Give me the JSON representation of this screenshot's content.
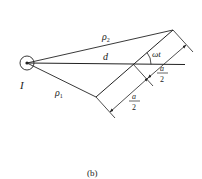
{
  "figure": {
    "caption": "(b)",
    "labels": {
      "source": "I",
      "rho1_base": "ρ",
      "rho1_sub": "1",
      "rho2_base": "ρ",
      "rho2_sub": "2",
      "distance": "d",
      "angle": "ωt",
      "half_a_upper_num": "a",
      "half_a_upper_den": "2",
      "half_a_lower_num": "a",
      "half_a_lower_den": "2"
    },
    "colors": {
      "stroke": "#222222",
      "background": "#ffffff"
    }
  }
}
